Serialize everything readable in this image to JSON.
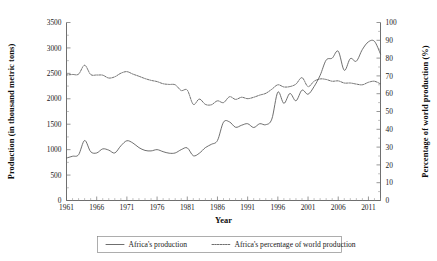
{
  "chart_data": {
    "type": "line",
    "title": "",
    "xlabel": "Year",
    "ylabel": "Production (in thousand metric tons)",
    "y2label": "Percentage of world production (%)",
    "xlim": [
      1961,
      2013
    ],
    "ylim": [
      0,
      3500
    ],
    "y2lim": [
      0,
      100
    ],
    "grid": false,
    "legend_position": "bottom",
    "xticks": [
      "1961",
      "1966",
      "1971",
      "1976",
      "1981",
      "1986",
      "1991",
      "1996",
      "2001",
      "2006",
      "2011"
    ],
    "xtick_values": [
      1961,
      1966,
      1971,
      1976,
      1981,
      1986,
      1991,
      1996,
      2001,
      2006,
      2011
    ],
    "yticks": [
      "0",
      "500",
      "1000",
      "1500",
      "2000",
      "2500",
      "3000",
      "3500"
    ],
    "ytick_values": [
      0,
      500,
      1000,
      1500,
      2000,
      2500,
      3000,
      3500
    ],
    "y2ticks": [
      "0",
      "10",
      "20",
      "30",
      "40",
      "50",
      "60",
      "70",
      "80",
      "90",
      "100"
    ],
    "y2tick_values": [
      0,
      10,
      20,
      30,
      40,
      50,
      60,
      70,
      80,
      90,
      100
    ],
    "x": [
      1961,
      1962,
      1963,
      1964,
      1965,
      1966,
      1967,
      1968,
      1969,
      1970,
      1971,
      1972,
      1973,
      1974,
      1975,
      1976,
      1977,
      1978,
      1979,
      1980,
      1981,
      1982,
      1983,
      1984,
      1985,
      1986,
      1987,
      1988,
      1989,
      1990,
      1991,
      1992,
      1993,
      1994,
      1995,
      1996,
      1997,
      1998,
      1999,
      2000,
      2001,
      2002,
      2003,
      2004,
      2005,
      2006,
      2007,
      2008,
      2009,
      2010,
      2011,
      2012,
      2013
    ],
    "series": [
      {
        "name": "Africa's production",
        "axis": "left",
        "style": "solid",
        "unit": "thousand metric tons",
        "values": [
          835,
          870,
          900,
          1180,
          960,
          935,
          1015,
          990,
          935,
          1075,
          1175,
          1130,
          1040,
          985,
          975,
          1000,
          960,
          930,
          935,
          1000,
          1035,
          880,
          930,
          1040,
          1105,
          1180,
          1540,
          1545,
          1440,
          1480,
          1510,
          1435,
          1510,
          1490,
          1600,
          2130,
          1910,
          2105,
          1960,
          2170,
          2090,
          2240,
          2460,
          2760,
          2800,
          2935,
          2560,
          2790,
          2740,
          2970,
          3120,
          3130,
          2880
        ]
      },
      {
        "name": "Africa's percentage of world production",
        "axis": "right",
        "style": "dotted",
        "unit": "%",
        "values": [
          70.5,
          70.8,
          71.0,
          76.0,
          70.8,
          70.5,
          70.4,
          68.8,
          69.5,
          71.5,
          72.4,
          71.0,
          69.8,
          68.5,
          67.5,
          66.8,
          65.6,
          65.2,
          65.0,
          61.8,
          62.0,
          54.0,
          57.0,
          54.0,
          53.8,
          56.0,
          55.0,
          58.3,
          56.8,
          58.0,
          57.2,
          58.0,
          59.2,
          60.2,
          62.5,
          65.0,
          63.8,
          64.0,
          65.4,
          69.0,
          64.0,
          67.0,
          68.3,
          68.0,
          67.0,
          67.2,
          66.0,
          66.0,
          65.4,
          65.0,
          66.4,
          67.0,
          65.5
        ]
      }
    ]
  }
}
